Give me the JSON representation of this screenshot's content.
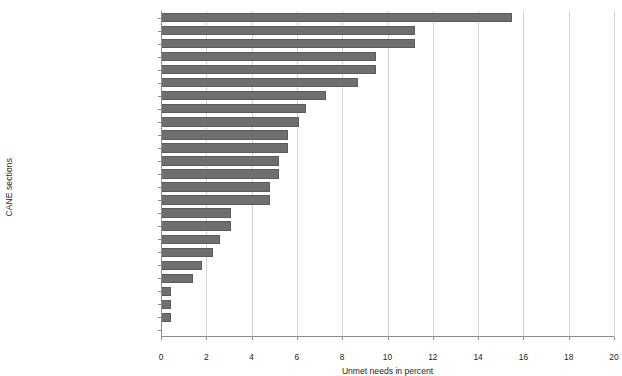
{
  "chart_data": {
    "type": "bar",
    "orientation": "horizontal",
    "title": "",
    "xlabel": "Unmet needs in percent",
    "ylabel": "CANE sections",
    "xlim": [
      0,
      20
    ],
    "xticks": [
      0,
      2,
      4,
      6,
      8,
      10,
      12,
      14,
      16,
      18,
      20
    ],
    "grid": true,
    "legend": null,
    "bar_color": "#6f6f6f",
    "categories": [
      "Physical health",
      "Information",
      "Mobility",
      "Eyesight/hearing/communication",
      "Accommodation",
      "Psychological distress",
      "Behaviour",
      "Company",
      "Daytime activities",
      "Falls",
      "Medication",
      "Looking after home",
      "Benefits",
      "Continence",
      "Intimate relationships",
      "Selfcare",
      "Memory",
      "Food",
      "Deliberate self-harm",
      "Money/budgeting",
      "Inadvertent self-harm",
      "Caring for someone else",
      "Alcohol",
      "Abuse/neglect",
      "Psychotic symptoms"
    ],
    "values": [
      15.5,
      11.2,
      11.2,
      9.5,
      9.5,
      8.7,
      7.3,
      6.4,
      6.1,
      5.6,
      5.6,
      5.2,
      5.2,
      4.8,
      4.8,
      3.1,
      3.1,
      2.6,
      2.3,
      1.8,
      1.4,
      0.45,
      0.45,
      0.45,
      0.0
    ]
  }
}
